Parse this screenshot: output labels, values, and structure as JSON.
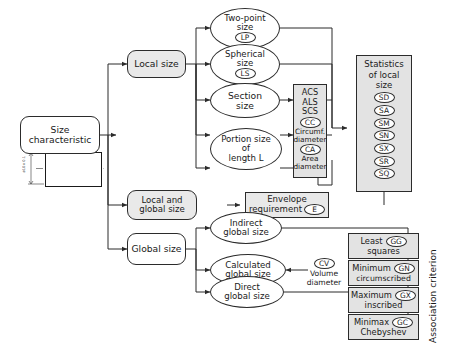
{
  "diagram": {
    "title_vertical": "Association criterion",
    "root": {
      "label_line1": "Size",
      "label_line2": "characteristic"
    },
    "part_drawing": {
      "dimension_text": "ø10±0.1"
    },
    "branches": [
      {
        "label": "Local size"
      },
      {
        "label_line1": "Local and",
        "label_line2": "global size"
      },
      {
        "label": "Global size"
      }
    ],
    "local_size_nodes": [
      {
        "line1": "Two-point",
        "line2": "size",
        "code": "LP"
      },
      {
        "line1": "Spherical",
        "line2": "size",
        "code": "LS"
      },
      {
        "line1": "Section",
        "line2": "size",
        "code": ""
      },
      {
        "line1": "Portion size",
        "line2": "of",
        "line3": "length L",
        "code": ""
      }
    ],
    "section_detail": {
      "abbreviations": [
        "ACS",
        "ALS",
        "SCS"
      ],
      "items": [
        {
          "code": "CC",
          "caption_line1": "Circumf.",
          "caption_line2": "diameter"
        },
        {
          "code": "CA",
          "caption_line1": "Area",
          "caption_line2": "diameter"
        }
      ]
    },
    "statistics": {
      "title_line1": "Statistics",
      "title_line2": "of local",
      "title_line3": "size",
      "codes": [
        "SD",
        "SA",
        "SM",
        "SN",
        "SX",
        "SR",
        "SQ"
      ]
    },
    "envelope": {
      "line1": "Envelope",
      "line2": "requirement",
      "code": "E"
    },
    "global_size_nodes": [
      {
        "line1": "Indirect",
        "line2": "global size"
      },
      {
        "line1": "Calculated",
        "line2": "global size"
      },
      {
        "line1": "Direct",
        "line2": "global size"
      }
    ],
    "volume_note": {
      "code": "CV",
      "caption_line1": "Volume",
      "caption_line2": "diameter"
    },
    "association_criteria": [
      {
        "line1": "Least",
        "line2": "squares",
        "code": "GG"
      },
      {
        "line1": "Minimum",
        "line2": "circumscribed",
        "code": "GN"
      },
      {
        "line1": "Maximum",
        "line2": "inscribed",
        "code": "GX"
      },
      {
        "line1": "Minimax",
        "line2": "Chebyshev",
        "code": "GC"
      }
    ],
    "colors": {
      "line": "#2b2b2b",
      "fill_gray": "#e9e9e9",
      "fill_panel": "#e3e3e3",
      "white": "#ffffff"
    }
  }
}
